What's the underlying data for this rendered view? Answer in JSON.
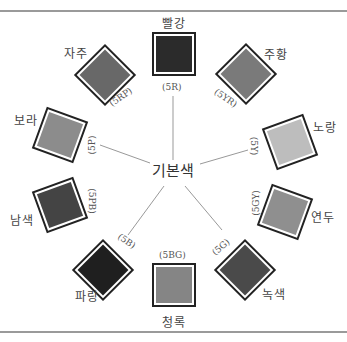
{
  "center_label": "기본색",
  "hues": [
    {
      "name": "빨강",
      "code": "(5R)",
      "color": "#2b2b2b"
    },
    {
      "name": "주황",
      "code": "(5YR)",
      "color": "#7a7a7a"
    },
    {
      "name": "노랑",
      "code": "(5Y)",
      "color": "#bdbdbd"
    },
    {
      "name": "연두",
      "code": "(5GY)",
      "color": "#8f8f8f"
    },
    {
      "name": "녹색",
      "code": "(5G)",
      "color": "#4a4a4a"
    },
    {
      "name": "청록",
      "code": "(5BG)",
      "color": "#858585"
    },
    {
      "name": "파랑",
      "code": "(5B)",
      "color": "#1f1f1f"
    },
    {
      "name": "남색",
      "code": "(5PB)",
      "color": "#444444"
    },
    {
      "name": "보라",
      "code": "(5P)",
      "color": "#8c8c8c"
    },
    {
      "name": "자주",
      "code": "(5RP)",
      "color": "#686868"
    }
  ]
}
